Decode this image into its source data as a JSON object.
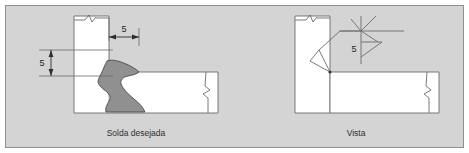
{
  "figure": {
    "background_color": "#d4d4d4",
    "border_color": "#8f8f8f",
    "line_color": "#6b6b6b",
    "weld_fill_color": "#909090",
    "weld_edge_color": "#4a4a4a",
    "text_color": "#2e2e2e"
  },
  "left_view": {
    "caption": "Solda desejada",
    "dimensions": [
      {
        "name": "horizontal-leg-size",
        "value": "5",
        "orientation": "horizontal"
      },
      {
        "name": "vertical-leg-size",
        "value": "5",
        "orientation": "vertical"
      }
    ],
    "parts": [
      {
        "name": "vertical-plate"
      },
      {
        "name": "horizontal-plate"
      },
      {
        "name": "weld-bead"
      }
    ],
    "break_marks": 2
  },
  "right_view": {
    "caption": "Vista",
    "weld_symbol": {
      "size": "5",
      "symbol_type": "fillet-weld-triangle",
      "name": "welding-symbol"
    },
    "parts": [
      {
        "name": "vertical-plate"
      },
      {
        "name": "horizontal-plate"
      }
    ],
    "break_marks": 2
  }
}
